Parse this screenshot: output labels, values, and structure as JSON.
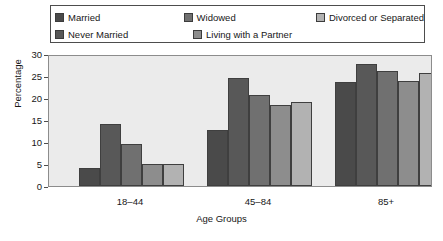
{
  "chart_data": {
    "type": "bar",
    "title": "",
    "xlabel": "Age Groups",
    "ylabel": "Percentage",
    "categories": [
      "18–44",
      "45–84",
      "85+"
    ],
    "series": [
      {
        "name": "Married",
        "color": "#4a4a4a",
        "values": [
          4.2,
          12.7,
          23.6
        ]
      },
      {
        "name": "Never Married",
        "color": "#585858",
        "values": [
          14.2,
          24.6,
          27.7
        ]
      },
      {
        "name": "Widowed",
        "color": "#707070",
        "values": [
          9.6,
          20.6,
          26.2
        ]
      },
      {
        "name": "Living with a Partner",
        "color": "#8d8d8d",
        "values": [
          4.9,
          18.4,
          23.8
        ]
      },
      {
        "name": "Divorced or Separated",
        "color": "#b2b2b2",
        "values": [
          4.9,
          19.1,
          25.7
        ]
      }
    ],
    "ylim": [
      0,
      30
    ],
    "yticks": [
      0,
      5,
      10,
      15,
      20,
      25,
      30
    ],
    "grid": false,
    "legend_position": "top",
    "plot_background": "#ebebeb"
  },
  "legend": {
    "rows": [
      [
        {
          "label": "Married",
          "color": "#4a4a4a"
        },
        {
          "label": "Widowed",
          "color": "#707070"
        },
        {
          "label": "Divorced or Separated",
          "color": "#b2b2b2"
        }
      ],
      [
        {
          "label": "Never Married",
          "color": "#585858"
        },
        {
          "label": "Living with a Partner",
          "color": "#8d8d8d"
        }
      ]
    ]
  }
}
